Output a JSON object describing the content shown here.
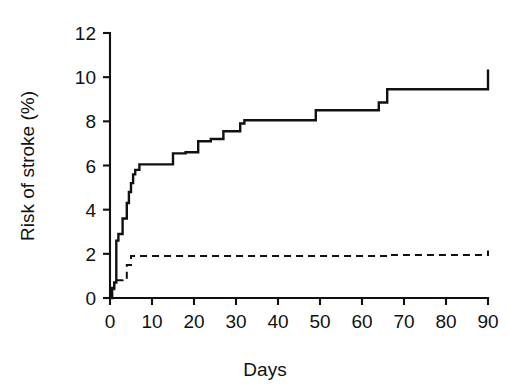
{
  "chart_data": {
    "type": "line",
    "title": "",
    "subtitle": "",
    "xlabel": "Days",
    "ylabel": "Risk of stroke (%)",
    "xlim": [
      0,
      90
    ],
    "ylim": [
      0,
      12
    ],
    "xticks": [
      0,
      10,
      20,
      30,
      40,
      50,
      60,
      70,
      80,
      90
    ],
    "yticks": [
      0,
      2,
      4,
      6,
      8,
      10,
      12
    ],
    "xtick_labels": [
      "0",
      "10",
      "20",
      "30",
      "40",
      "50",
      "60",
      "70",
      "80",
      "90"
    ],
    "ytick_labels": [
      "0",
      "2",
      "4",
      "6",
      "8",
      "10",
      "12"
    ],
    "grid": false,
    "legend": false,
    "legend_position": "none",
    "step_style": "post",
    "annotations": [],
    "series": [
      {
        "name": "solid-curve",
        "style": "solid",
        "color": "#111111",
        "x": [
          0,
          0.5,
          1,
          1.5,
          2,
          3,
          4,
          4.5,
          5,
          5.5,
          6,
          7,
          12,
          15,
          18,
          21,
          24,
          27,
          31,
          32,
          42,
          49,
          64,
          66,
          90
        ],
        "y": [
          0,
          0.45,
          0.7,
          2.6,
          2.9,
          3.6,
          4.3,
          4.8,
          5.2,
          5.6,
          5.8,
          6.05,
          6.05,
          6.55,
          6.6,
          7.1,
          7.2,
          7.55,
          7.9,
          8.05,
          8.05,
          8.5,
          8.85,
          9.45,
          10.35
        ],
        "final_value": 10.35
      },
      {
        "name": "dashed-curve",
        "style": "dashed",
        "color": "#111111",
        "x": [
          0,
          0.5,
          1,
          3,
          4,
          5,
          66,
          90
        ],
        "y": [
          0,
          0.3,
          0.8,
          0.85,
          1.5,
          1.9,
          1.95,
          2.15
        ],
        "final_value": 2.15
      }
    ]
  },
  "figure": {
    "background_color": "#ffffff",
    "foreground_color": "#111111"
  }
}
